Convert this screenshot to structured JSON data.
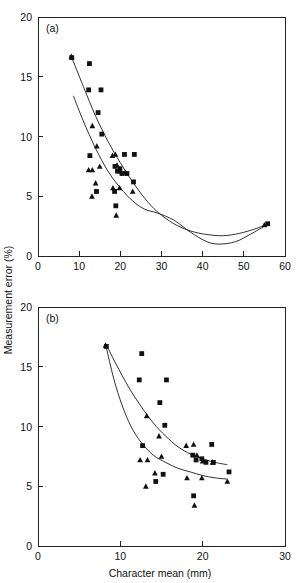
{
  "figure": {
    "axis_titles": {
      "y": "Measurement error (%)",
      "x": "Character mean (mm)"
    }
  },
  "chart_data": [
    {
      "type": "scatter",
      "panel": "(a)",
      "title": "",
      "xlabel": "Character mean (mm)",
      "ylabel": "Measurement error (%)",
      "xlim": [
        0,
        60
      ],
      "ylim": [
        0,
        20
      ],
      "xticks": [
        0,
        10,
        20,
        30,
        40,
        50,
        60
      ],
      "yticks": [
        0,
        5,
        10,
        15,
        20
      ],
      "grid": false,
      "legend": "none",
      "series": [
        {
          "name": "squares",
          "marker": "square",
          "points": [
            [
              8.2,
              16.6
            ],
            [
              12.5,
              16.1
            ],
            [
              12.3,
              13.9
            ],
            [
              15.3,
              13.9
            ],
            [
              14.6,
              12.0
            ],
            [
              15.5,
              10.2
            ],
            [
              12.6,
              8.4
            ],
            [
              21.0,
              8.5
            ],
            [
              23.4,
              8.5
            ],
            [
              18.7,
              7.5
            ],
            [
              19.3,
              7.1
            ],
            [
              19.9,
              7.3
            ],
            [
              20.4,
              6.9
            ],
            [
              21.6,
              6.9
            ],
            [
              23.2,
              6.2
            ],
            [
              14.2,
              5.4
            ],
            [
              18.6,
              5.4
            ],
            [
              18.9,
              4.2
            ],
            [
              55.8,
              2.7
            ]
          ]
        },
        {
          "name": "triangles",
          "marker": "triangle",
          "points": [
            [
              8.1,
              16.7
            ],
            [
              13.2,
              10.9
            ],
            [
              14.3,
              9.2
            ],
            [
              18.1,
              8.4
            ],
            [
              18.8,
              8.5
            ],
            [
              15.0,
              7.5
            ],
            [
              12.3,
              7.2
            ],
            [
              13.2,
              7.2
            ],
            [
              19.2,
              7.6
            ],
            [
              20.0,
              7.1
            ],
            [
              21.2,
              7.0
            ],
            [
              14.0,
              6.1
            ],
            [
              18.2,
              5.7
            ],
            [
              19.8,
              5.7
            ],
            [
              23.0,
              5.4
            ],
            [
              13.1,
              5.0
            ],
            [
              19.0,
              3.4
            ],
            [
              55.0,
              2.6
            ]
          ]
        }
      ],
      "curves": [
        {
          "name": "upper-fit",
          "points": [
            [
              8.1,
              16.7
            ],
            [
              11.0,
              14.2
            ],
            [
              14.0,
              11.7
            ],
            [
              17.0,
              9.6
            ],
            [
              20.0,
              7.8
            ],
            [
              23.0,
              6.2
            ],
            [
              26.0,
              4.8
            ],
            [
              29.0,
              3.7
            ],
            [
              33.0,
              2.7
            ],
            [
              37.0,
              2.1
            ],
            [
              41.0,
              1.8
            ],
            [
              45.0,
              1.7
            ],
            [
              49.0,
              1.9
            ],
            [
              53.0,
              2.3
            ],
            [
              56.0,
              2.7
            ]
          ]
        },
        {
          "name": "lower-fit",
          "points": [
            [
              8.6,
              13.4
            ],
            [
              11.0,
              11.3
            ],
            [
              14.0,
              9.0
            ],
            [
              17.0,
              7.1
            ],
            [
              20.0,
              5.7
            ],
            [
              23.0,
              4.6
            ],
            [
              26.0,
              3.9
            ],
            [
              29.0,
              3.6
            ],
            [
              33.0,
              3.0
            ],
            [
              37.0,
              2.0
            ],
            [
              41.0,
              1.2
            ],
            [
              44.0,
              1.0
            ],
            [
              48.0,
              1.2
            ],
            [
              52.0,
              1.9
            ],
            [
              56.0,
              2.7
            ]
          ]
        }
      ]
    },
    {
      "type": "scatter",
      "panel": "(b)",
      "title": "",
      "xlabel": "Character mean (mm)",
      "ylabel": "Measurement error (%)",
      "xlim": [
        0,
        30
      ],
      "ylim": [
        0,
        20
      ],
      "xticks": [
        0,
        10,
        20,
        30
      ],
      "yticks": [
        0,
        5,
        10,
        15,
        20
      ],
      "grid": false,
      "legend": "none",
      "series": [
        {
          "name": "squares",
          "marker": "square",
          "points": [
            [
              8.3,
              16.7
            ],
            [
              12.6,
              16.1
            ],
            [
              12.3,
              13.9
            ],
            [
              15.6,
              13.9
            ],
            [
              14.8,
              12.0
            ],
            [
              15.4,
              10.1
            ],
            [
              12.7,
              8.4
            ],
            [
              21.1,
              8.5
            ],
            [
              18.8,
              7.6
            ],
            [
              19.2,
              7.2
            ],
            [
              19.9,
              7.3
            ],
            [
              20.4,
              7.0
            ],
            [
              21.3,
              7.0
            ],
            [
              23.2,
              6.2
            ],
            [
              14.3,
              5.4
            ],
            [
              15.2,
              6.0
            ],
            [
              18.9,
              4.2
            ]
          ]
        },
        {
          "name": "triangles",
          "marker": "triangle",
          "points": [
            [
              8.2,
              16.8
            ],
            [
              13.2,
              10.9
            ],
            [
              14.7,
              9.2
            ],
            [
              18.0,
              8.4
            ],
            [
              18.9,
              8.5
            ],
            [
              15.0,
              7.5
            ],
            [
              12.4,
              7.2
            ],
            [
              13.3,
              7.2
            ],
            [
              19.3,
              7.6
            ],
            [
              20.0,
              7.1
            ],
            [
              21.2,
              7.0
            ],
            [
              14.2,
              6.1
            ],
            [
              18.1,
              5.7
            ],
            [
              19.9,
              5.7
            ],
            [
              23.0,
              5.4
            ],
            [
              13.1,
              5.0
            ],
            [
              19.0,
              3.4
            ]
          ]
        }
      ],
      "curves": [
        {
          "name": "upper-fit",
          "points": [
            [
              8.4,
              16.7
            ],
            [
              9.5,
              15.2
            ],
            [
              11.0,
              13.3
            ],
            [
              12.5,
              11.7
            ],
            [
              14.0,
              10.3
            ],
            [
              15.5,
              9.2
            ],
            [
              17.0,
              8.3
            ],
            [
              18.5,
              7.7
            ],
            [
              20.0,
              7.3
            ],
            [
              21.5,
              7.0
            ],
            [
              23.0,
              6.8
            ]
          ]
        },
        {
          "name": "lower-fit",
          "points": [
            [
              8.3,
              16.6
            ],
            [
              9.2,
              14.0
            ],
            [
              10.2,
              11.8
            ],
            [
              11.3,
              10.0
            ],
            [
              12.5,
              8.7
            ],
            [
              14.0,
              7.6
            ],
            [
              15.5,
              7.0
            ],
            [
              17.0,
              6.5
            ],
            [
              18.5,
              6.2
            ],
            [
              20.0,
              5.9
            ],
            [
              21.5,
              5.7
            ],
            [
              23.0,
              5.6
            ]
          ]
        }
      ]
    }
  ]
}
